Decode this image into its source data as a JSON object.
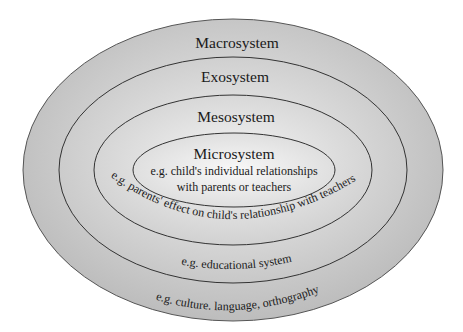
{
  "diagram": {
    "type": "nested-ellipses",
    "layers": [
      {
        "name": "Macrosystem",
        "example": "e.g. culture. language, orthography"
      },
      {
        "name": "Exosystem",
        "example": "e.g. educational system"
      },
      {
        "name": "Mesosystem",
        "example": "e.g. parents' effect on child's relationship with teachers"
      },
      {
        "name": "Microsystem",
        "example_line1": "e.g. child's individual relationships",
        "example_line2": "with parents or teachers"
      }
    ],
    "colors": {
      "fill_light": "#f4f4f4",
      "fill_dark": "#bdbdbd",
      "stroke": "#3a3a3a"
    }
  }
}
